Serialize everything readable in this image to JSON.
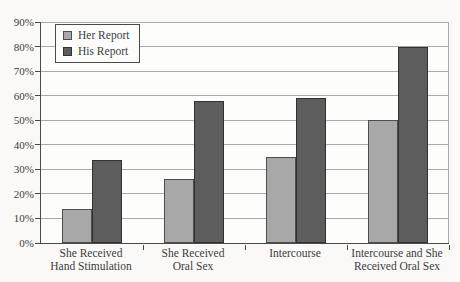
{
  "chart_data": {
    "type": "bar",
    "title": "",
    "xlabel": "",
    "ylabel": "",
    "categories": [
      "She Received\nHand Stimulation",
      "She Received\nOral Sex",
      "Intercourse",
      "Intercourse and She\nReceived Oral Sex"
    ],
    "series": [
      {
        "name": "Her Report",
        "values": [
          14,
          26,
          35,
          50
        ],
        "color": "#a8a8a8",
        "border_color": "#4e4e4e"
      },
      {
        "name": "His Report",
        "values": [
          34,
          58,
          59,
          80
        ],
        "color": "#5d5d5d",
        "border_color": "#313131"
      }
    ],
    "ylim": [
      0,
      90
    ],
    "ytick_step": 10,
    "ytick_labels": [
      "0%",
      "10%",
      "20%",
      "30%",
      "40%",
      "50%",
      "60%",
      "70%",
      "80%",
      "90%"
    ],
    "grid": true,
    "legend_position": "top-left"
  },
  "colors": {
    "background": "#faf9f7",
    "gridline": "#a9a9a9",
    "axis": "#4a4a4a",
    "text": "#3d3d3d"
  }
}
